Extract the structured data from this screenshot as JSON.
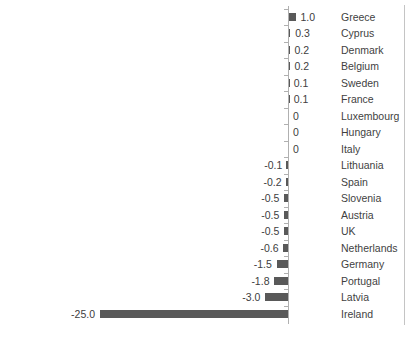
{
  "chart_data": {
    "type": "bar",
    "orientation": "horizontal",
    "title": "",
    "xlabel": "",
    "ylabel": "",
    "xlim": [
      -25,
      1
    ],
    "grid": false,
    "legend": false,
    "bar_color": "#595959",
    "axis_color": "#b0b0b0",
    "categories": [
      "Greece",
      "Cyprus",
      "Denmark",
      "Belgium",
      "Sweden",
      "France",
      "Luxembourg",
      "Hungary",
      "Italy",
      "Lithuania",
      "Spain",
      "Slovenia",
      "Austria",
      "UK",
      "Netherlands",
      "Germany",
      "Portugal",
      "Latvia",
      "Ireland"
    ],
    "values": [
      1.0,
      0.3,
      0.2,
      0.2,
      0.1,
      0.1,
      0,
      0,
      0,
      -0.1,
      -0.2,
      -0.5,
      -0.5,
      -0.5,
      -0.6,
      -1.5,
      -1.8,
      -3.0,
      -25.0
    ],
    "value_labels": [
      "1.0",
      "0.3",
      "0.2",
      "0.2",
      "0.1",
      "0.1",
      "0",
      "0",
      "0",
      "-0.1",
      "-0.2",
      "-0.5",
      "-0.5",
      "-0.5",
      "-0.6",
      "-1.5",
      "-1.8",
      "-3.0",
      "-25.0"
    ]
  },
  "footnote": ""
}
